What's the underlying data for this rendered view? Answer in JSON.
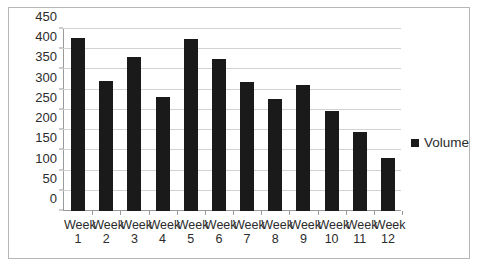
{
  "chart_data": {
    "type": "bar",
    "title": "",
    "subtitle": "",
    "xlabel": "",
    "ylabel": "",
    "categories": [
      "Week 1",
      "Week 2",
      "Week 3",
      "Week 4",
      "Week 5",
      "Week 6",
      "Week 7",
      "Week 8",
      "Week 9",
      "Week 10",
      "Week 11",
      "Week 12"
    ],
    "category_lines": [
      {
        "top": "Week",
        "bottom": "1"
      },
      {
        "top": "Week",
        "bottom": "2"
      },
      {
        "top": "Week",
        "bottom": "3"
      },
      {
        "top": "Week",
        "bottom": "4"
      },
      {
        "top": "Week",
        "bottom": "5"
      },
      {
        "top": "Week",
        "bottom": "6"
      },
      {
        "top": "Week",
        "bottom": "7"
      },
      {
        "top": "Week",
        "bottom": "8"
      },
      {
        "top": "Week",
        "bottom": "9"
      },
      {
        "top": "Week",
        "bottom": "10"
      },
      {
        "top": "Week",
        "bottom": "11"
      },
      {
        "top": "Week",
        "bottom": "12"
      }
    ],
    "series": [
      {
        "name": "Volume",
        "color": "#1a1a1a",
        "values": [
          427,
          322,
          381,
          281,
          425,
          376,
          320,
          276,
          311,
          248,
          196,
          131
        ]
      }
    ],
    "ylim": [
      0,
      450
    ],
    "ytick_values": [
      0,
      50,
      100,
      150,
      200,
      250,
      300,
      350,
      400,
      450
    ],
    "ytick_labels": [
      "0",
      "50",
      "100",
      "150",
      "200",
      "250",
      "300",
      "350",
      "400",
      "450"
    ],
    "grid": true,
    "grid_axis": "y",
    "legend": {
      "position": "right",
      "entries": [
        {
          "label": "Volume",
          "color": "#1a1a1a",
          "marker": "square-swatch"
        }
      ]
    },
    "plot_background": "#ffffff",
    "gridline_color": "#d2d2d2",
    "axis_color": "#9a9a9a",
    "border_color": "#b6b6b6"
  }
}
